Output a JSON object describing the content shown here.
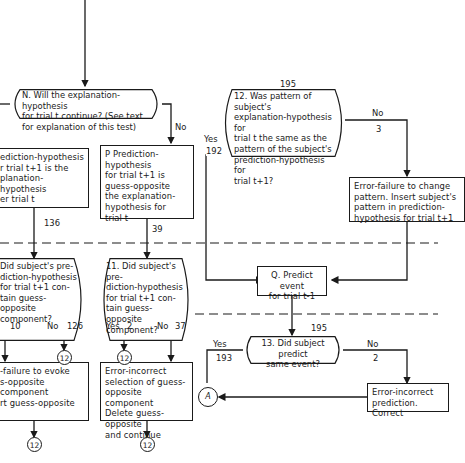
{
  "diagram": {
    "nodes": {
      "N": {
        "text": "N. Will the explanation-hypothesis\nfor trial t continue? (See text\nfor explanation of this test)"
      },
      "pred_left": {
        "text": "ediction-hypothesis\nr trial t+1 is the\nplanation-hypothesis\ner trial t"
      },
      "P": {
        "text": "P Prediction-hypothesis\nfor trial t+1 is\nguess-opposite\nthe explanation-\nhypothesis for\ntrial t"
      },
      "d12": {
        "text": "12. Was pattern of subject's\nexplanation-hypothesis for\ntrial t the same as the\npattern of the subject's\nprediction-hypothesis for\ntrial t+1?"
      },
      "err_change": {
        "text": "Error-failure to change\npattern. Insert subject's\npattern in prediction-\nhypothesis for trial t+1"
      },
      "d_left": {
        "text": "Did subject's pre-\ndiction-hypothesis\nfor trial t+1 con-\ntain guess-\nopposite component?"
      },
      "d11": {
        "text": "11. Did subject's pre-\ndiction-hypothesis\nfor trial t+1 con-\ntain guess-\nopposite component?"
      },
      "Q": {
        "text": "Q. Predict event\nfor trial t-1"
      },
      "d13": {
        "text": "13. Did subject predict\nsame event?"
      },
      "err_evoke": {
        "text": "-failure to evoke\ns-opposite component\nrt guess-opposite"
      },
      "err_select": {
        "text": "Error-incorrect\nselection of guess-\nopposite component\nDelete guess-opposite\nand continue"
      },
      "err_predict": {
        "text": "Error-incorrect\nprediction. Correct"
      }
    },
    "edge_labels": {
      "n_no": "No",
      "c136": "136",
      "c39": "39",
      "c195_top": "195",
      "d12_yes": "Yes",
      "c192": "192",
      "d12_no": "No",
      "c3": "3",
      "c10": "10",
      "left_no": "No",
      "c126": "126",
      "d11_yes": "Yes",
      "c2_yes": "2",
      "d11_no": "No",
      "c37": "37",
      "c195_bot": "195",
      "d13_yes": "Yes",
      "c193": "193",
      "d13_no": "No",
      "c2_no": "2"
    },
    "connectors": {
      "to12_a": "12",
      "to12_b": "12",
      "to12_c": "12",
      "to12_d": "12",
      "A": "A"
    }
  }
}
